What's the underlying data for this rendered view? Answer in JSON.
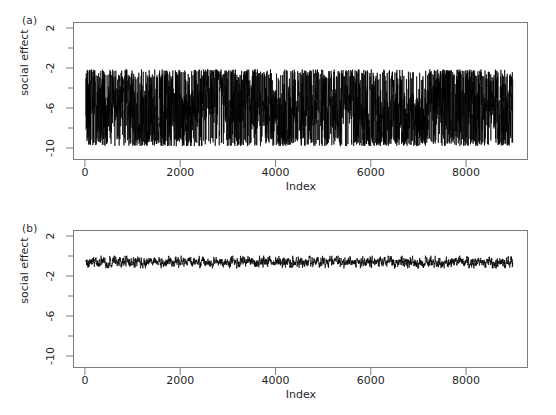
{
  "figure": {
    "background": "#ffffff",
    "line_color": "#000000",
    "axis_color": "#7d7d7d",
    "text_color": "#1f1f1f",
    "width": 556,
    "height": 415
  },
  "panels": [
    {
      "tag": "(a)",
      "ylabel": "social effect",
      "xlabel": "Index"
    },
    {
      "tag": "(b)",
      "ylabel": "social effect",
      "xlabel": "Index"
    }
  ],
  "axes": {
    "y_tick_labels": [
      "2",
      "-2",
      "-6",
      "-10"
    ],
    "y_tick_values": [
      2,
      -2,
      -6,
      -10
    ],
    "y_minor_count": 3,
    "x_tick_labels": [
      "0",
      "2000",
      "4000",
      "6000",
      "8000"
    ],
    "x_tick_values": [
      0,
      2000,
      4000,
      6000,
      8000
    ]
  },
  "chart_data": [
    {
      "type": "line",
      "panel": "(a)",
      "title": "",
      "xlabel": "Index",
      "ylabel": "social effect",
      "xlim": [
        -250,
        9300
      ],
      "ylim": [
        -11.2,
        2.6
      ],
      "grid": false,
      "legend": null,
      "n_points": 9000,
      "description": "MCMC trace plot, poorly mixing chain with very large oscillations",
      "series": [
        {
          "name": "social effect trace (unconverged)",
          "color": "#000000",
          "x_start": 0,
          "x_end": 9000,
          "mean": -6.1,
          "min": -10.0,
          "max": -1.9,
          "envelope_upper": -2.1,
          "envelope_lower": -9.9,
          "noise_sd": 2.3,
          "sample_values": [
            -6.4,
            -9.5,
            -2.6,
            -8.8,
            -4.1,
            -9.7,
            -3.0,
            -7.2,
            -5.5,
            -9.9,
            -2.4,
            -8.1,
            -6.9,
            -3.3,
            -9.4,
            -5.0,
            -2.2,
            -8.6,
            -7.4,
            -4.4,
            -9.8,
            -3.7,
            -6.0,
            -9.1,
            -2.8,
            -7.8,
            -5.2,
            -9.6,
            -4.7,
            -2.3,
            -8.3,
            -6.6,
            -9.9,
            -3.5,
            -7.0,
            -5.8,
            -2.5,
            -9.2,
            -4.9,
            -8.0,
            -6.3,
            -9.7,
            -3.1,
            -7.6,
            -5.4,
            -2.1,
            -8.9,
            -6.8,
            -9.5,
            -4.2
          ]
        }
      ]
    },
    {
      "type": "line",
      "panel": "(b)",
      "title": "",
      "xlabel": "Index",
      "ylabel": "social effect",
      "xlim": [
        -250,
        9300
      ],
      "ylim": [
        -11.2,
        2.6
      ],
      "grid": false,
      "legend": null,
      "n_points": 9000,
      "description": "MCMC trace plot, well mixing converged chain, tight band near -0.5",
      "series": [
        {
          "name": "social effect trace (converged)",
          "color": "#000000",
          "x_start": 0,
          "x_end": 9000,
          "mean": -0.55,
          "min": -1.25,
          "max": 0.15,
          "envelope_upper": 0.1,
          "envelope_lower": -1.2,
          "noise_sd": 0.22,
          "sample_values": [
            -0.55,
            -0.4,
            -0.72,
            -0.48,
            -0.61,
            -0.33,
            -0.8,
            -0.52,
            -0.44,
            -0.68,
            -0.36,
            -0.75,
            -0.5,
            -0.59,
            -0.41,
            -0.85,
            -0.47,
            -0.63,
            -0.38,
            -0.7,
            -0.54,
            -0.29,
            -0.77,
            -0.46,
            -0.65,
            -0.42,
            -0.58,
            -0.31,
            -0.82,
            -0.51,
            -0.6,
            -0.39,
            -0.73,
            -0.49,
            -0.56,
            -0.35,
            -0.79,
            -0.53,
            -0.45,
            -0.67,
            -0.37,
            -0.74,
            -0.57,
            -0.43,
            -0.69,
            -0.34,
            -0.81,
            -0.5,
            -0.62,
            -0.4
          ]
        }
      ]
    }
  ]
}
